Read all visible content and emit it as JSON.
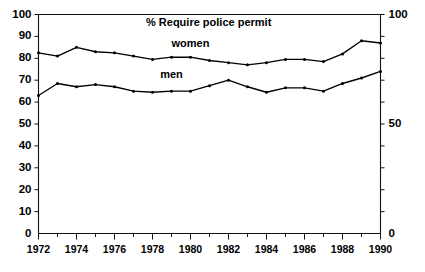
{
  "chart_data": {
    "type": "line",
    "title": "% Require police permit",
    "xlabel": "",
    "ylabel": "",
    "x": [
      1972,
      1973,
      1974,
      1975,
      1976,
      1977,
      1978,
      1979,
      1980,
      1981,
      1982,
      1983,
      1984,
      1985,
      1986,
      1987,
      1988,
      1989,
      1990
    ],
    "xtick_labels": [
      "1972",
      "1974",
      "1976",
      "1978",
      "1980",
      "1982",
      "1984",
      "1986",
      "1988",
      "1990"
    ],
    "xtick_values": [
      1972,
      1974,
      1976,
      1978,
      1980,
      1982,
      1984,
      1986,
      1988,
      1990
    ],
    "xlim": [
      1972,
      1990
    ],
    "ylim": [
      0,
      100
    ],
    "ytick_values_left": [
      0,
      10,
      20,
      30,
      40,
      50,
      60,
      70,
      80,
      90,
      100
    ],
    "ytick_labels_left": [
      "0",
      "10",
      "20",
      "30",
      "40",
      "50",
      "60",
      "70",
      "80",
      "90",
      "100"
    ],
    "ytick_values_right": [
      0,
      50,
      100
    ],
    "ytick_labels_right": [
      "0",
      "50",
      "100"
    ],
    "grid": false,
    "legend_position": "inline-annotations",
    "series": [
      {
        "name": "women",
        "label": "women",
        "label_x": 1980,
        "label_y": 85,
        "values": [
          82.5,
          81,
          85,
          83,
          82.5,
          81,
          79.5,
          80.5,
          80.5,
          79,
          78,
          77,
          78,
          79.5,
          79.5,
          78.5,
          82,
          88,
          87
        ]
      },
      {
        "name": "men",
        "label": "men",
        "label_x": 1979,
        "label_y": 71,
        "values": [
          63,
          68.5,
          67,
          68,
          67,
          65,
          64.5,
          65,
          65,
          67.5,
          70,
          67,
          64.5,
          66.5,
          66.5,
          65,
          68.5,
          71,
          74
        ]
      }
    ]
  }
}
